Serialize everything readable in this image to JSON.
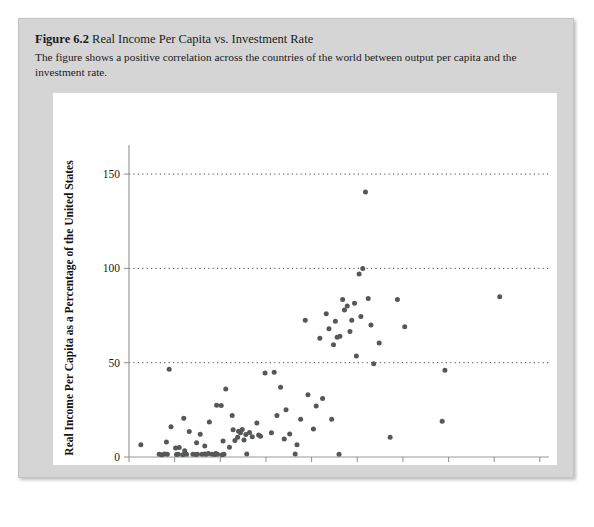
{
  "figure": {
    "label": "Figure 6.2",
    "title": "Real Income Per Capita vs. Investment Rate",
    "description": "The figure shows a positive correlation across the countries of the world between output per capita and the investment rate."
  },
  "colors": {
    "panel_background": "#d5d5d5",
    "chart_background": "#ffffff",
    "point": "#555759",
    "axis": "#9a9a9a",
    "gridline": "#2b2b2b",
    "text": "#1b1b1b"
  },
  "chart_data": {
    "type": "scatter",
    "title": "Real Income Per Capita vs. Investment Rate",
    "xlabel": "Investment Rate as a Percentage of Output",
    "ylabel": "Real Income Per Capita as a Percentage of the United States",
    "xlim": [
      0,
      46
    ],
    "ylim": [
      0,
      158
    ],
    "xticks": [
      0,
      5,
      10,
      15,
      20,
      25,
      30,
      35,
      40,
      45
    ],
    "xtick_labels": [
      "0",
      "5",
      "10",
      "15",
      "20",
      "25",
      "30",
      "35",
      "40",
      "45"
    ],
    "yticks": [
      0,
      50,
      100,
      150
    ],
    "ytick_labels": [
      "0",
      "50",
      "100",
      "150"
    ],
    "gridlines_y": [
      50,
      100,
      150
    ],
    "grid": "horizontal-dotted",
    "legend": null,
    "marker": "circle",
    "points": [
      [
        1.3,
        6.5
      ],
      [
        3.3,
        1.5
      ],
      [
        3.6,
        1.2
      ],
      [
        3.9,
        1.6
      ],
      [
        4.2,
        1.4
      ],
      [
        4.1,
        8.0
      ],
      [
        4.4,
        46.5
      ],
      [
        4.6,
        16.0
      ],
      [
        5.1,
        4.8
      ],
      [
        5.2,
        1.3
      ],
      [
        5.4,
        1.5
      ],
      [
        5.5,
        5.0
      ],
      [
        5.9,
        1.2
      ],
      [
        6.1,
        3.3
      ],
      [
        6.3,
        1.4
      ],
      [
        6.0,
        20.5
      ],
      [
        6.6,
        13.5
      ],
      [
        7.0,
        1.4
      ],
      [
        7.3,
        1.3
      ],
      [
        7.5,
        1.5
      ],
      [
        7.4,
        7.6
      ],
      [
        7.8,
        12.0
      ],
      [
        8.0,
        1.5
      ],
      [
        8.3,
        1.6
      ],
      [
        8.5,
        1.4
      ],
      [
        8.7,
        1.9
      ],
      [
        8.3,
        5.8
      ],
      [
        8.8,
        18.5
      ],
      [
        9.1,
        1.4
      ],
      [
        9.4,
        1.3
      ],
      [
        9.5,
        1.8
      ],
      [
        9.7,
        1.4
      ],
      [
        9.6,
        27.5
      ],
      [
        10.1,
        27.3
      ],
      [
        10.2,
        1.2
      ],
      [
        10.4,
        1.5
      ],
      [
        10.3,
        8.5
      ],
      [
        10.6,
        36.0
      ],
      [
        11.0,
        5.2
      ],
      [
        11.3,
        22.0
      ],
      [
        11.4,
        14.5
      ],
      [
        11.6,
        8.8
      ],
      [
        11.9,
        10.5
      ],
      [
        12.0,
        13.6
      ],
      [
        12.2,
        12.8
      ],
      [
        12.4,
        14.6
      ],
      [
        12.6,
        9.0
      ],
      [
        12.8,
        11.9
      ],
      [
        12.9,
        1.6
      ],
      [
        13.2,
        13.0
      ],
      [
        13.5,
        10.8
      ],
      [
        14.0,
        18.0
      ],
      [
        14.2,
        11.6
      ],
      [
        14.4,
        11.0
      ],
      [
        14.9,
        44.5
      ],
      [
        15.6,
        12.8
      ],
      [
        15.9,
        45.0
      ],
      [
        16.2,
        22.0
      ],
      [
        16.6,
        37.0
      ],
      [
        17.0,
        9.6
      ],
      [
        17.2,
        25.0
      ],
      [
        17.6,
        12.2
      ],
      [
        18.2,
        1.6
      ],
      [
        18.4,
        6.5
      ],
      [
        18.8,
        20.0
      ],
      [
        19.3,
        72.5
      ],
      [
        19.6,
        33.0
      ],
      [
        20.2,
        14.9
      ],
      [
        20.5,
        27.0
      ],
      [
        20.9,
        63.0
      ],
      [
        21.2,
        31.0
      ],
      [
        21.6,
        76.0
      ],
      [
        21.9,
        68.0
      ],
      [
        22.2,
        20.0
      ],
      [
        22.4,
        59.5
      ],
      [
        22.6,
        72.0
      ],
      [
        22.8,
        63.5
      ],
      [
        23.1,
        64.0
      ],
      [
        23.0,
        1.5
      ],
      [
        23.4,
        83.5
      ],
      [
        23.6,
        78.0
      ],
      [
        23.9,
        80.0
      ],
      [
        24.2,
        66.5
      ],
      [
        24.4,
        72.5
      ],
      [
        24.7,
        81.5
      ],
      [
        24.9,
        53.5
      ],
      [
        25.2,
        97.0
      ],
      [
        25.4,
        74.5
      ],
      [
        25.6,
        100.0
      ],
      [
        25.9,
        140.5
      ],
      [
        26.2,
        84.0
      ],
      [
        26.5,
        70.0
      ],
      [
        26.8,
        49.5
      ],
      [
        27.4,
        60.5
      ],
      [
        28.6,
        10.5
      ],
      [
        29.4,
        83.5
      ],
      [
        30.2,
        69.0
      ],
      [
        34.3,
        19.0
      ],
      [
        34.6,
        46.0
      ],
      [
        40.6,
        85.0
      ]
    ],
    "n_points": 103
  }
}
